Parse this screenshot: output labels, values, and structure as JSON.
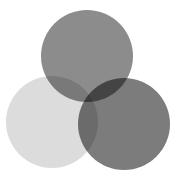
{
  "diagram": {
    "type": "venn",
    "width": 186,
    "height": 181,
    "background": "#ffffff",
    "circles": [
      {
        "id": "left",
        "cx": 52,
        "cy": 122,
        "r": 46,
        "color": "#dcdcdc"
      },
      {
        "id": "top",
        "cx": 87,
        "cy": 56,
        "r": 46,
        "color": "#8c8c8c"
      },
      {
        "id": "right",
        "cx": 124,
        "cy": 124,
        "r": 46,
        "color": "#7c7c7c"
      }
    ]
  }
}
